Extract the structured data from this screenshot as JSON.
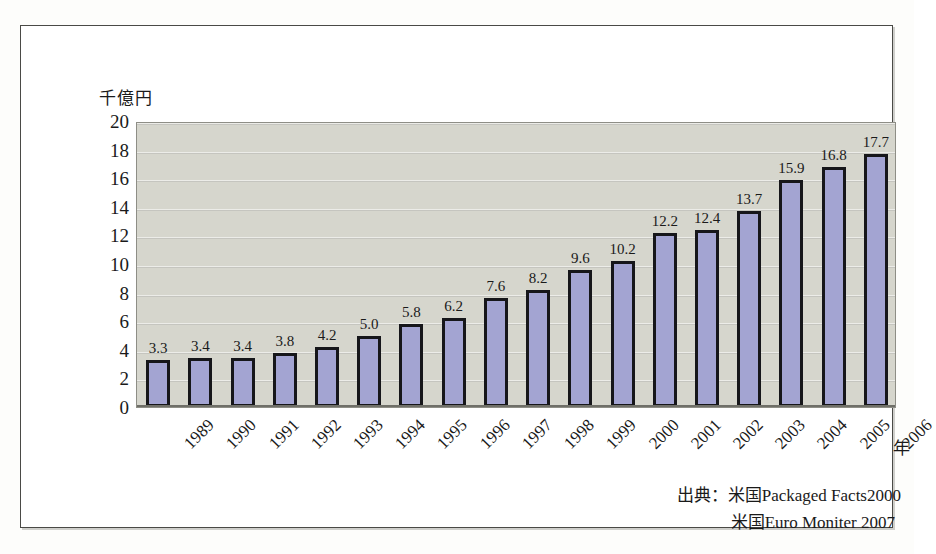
{
  "chart_data": {
    "type": "bar",
    "title": "",
    "subtitle": "",
    "xlabel": "年",
    "ylabel": "千億円",
    "ylim": [
      0,
      20
    ],
    "ytick_step": 2,
    "yticks": [
      "20",
      "18",
      "16",
      "14",
      "12",
      "10",
      "8",
      "6",
      "4",
      "2",
      "0"
    ],
    "grid": true,
    "legend": "none",
    "categories": [
      "1989",
      "1990",
      "1991",
      "1992",
      "1993",
      "1994",
      "1995",
      "1996",
      "1997",
      "1998",
      "1999",
      "2000",
      "2001",
      "2002",
      "2003",
      "2004",
      "2005",
      "2006"
    ],
    "values": [
      3.3,
      3.4,
      3.4,
      3.8,
      4.2,
      5.0,
      5.8,
      6.2,
      7.6,
      8.2,
      9.6,
      10.2,
      12.2,
      12.4,
      13.7,
      15.9,
      16.8,
      17.7
    ],
    "value_labels": [
      "3.3",
      "3.4",
      "3.4",
      "3.8",
      "4.2",
      "5.0",
      "5.8",
      "6.2",
      "7.6",
      "8.2",
      "9.6",
      "10.2",
      "12.2",
      "12.4",
      "13.7",
      "15.9",
      "16.8",
      "17.7"
    ],
    "annotations": [
      "出典：米国Packaged Facts2000",
      "米国Euro Moniter 2007"
    ]
  },
  "axes": {
    "y_title": "千億円",
    "x_unit": "年"
  },
  "source": {
    "line1": "出典：米国Packaged Facts2000",
    "line2": "米国Euro Moniter 2007"
  },
  "colors": {
    "bar_fill": "#a3a4d2",
    "bar_border": "#16161a",
    "plot_background": "#d6d6cd",
    "frame_border": "#4a4a46",
    "text": "#1a1a1a"
  }
}
